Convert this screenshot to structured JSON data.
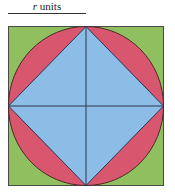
{
  "label": {
    "variable": "r",
    "unit_text": " units"
  },
  "diagram": {
    "colors": {
      "square_fill": "#8fbf5e",
      "circle_fill": "#d9566f",
      "diamond_fill": "#8cbde6",
      "stroke": "#3a3a3a"
    }
  }
}
